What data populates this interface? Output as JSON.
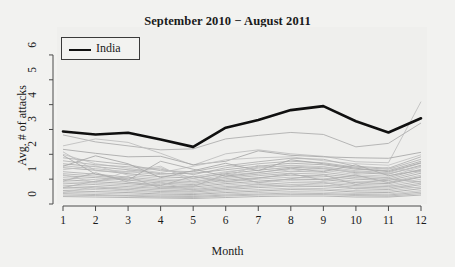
{
  "chart_data": {
    "type": "line",
    "title": "September 2010 − August 2011",
    "xlabel": "Month",
    "ylabel": "Avg. # of attacks",
    "xlim": [
      1,
      12
    ],
    "ylim": [
      0,
      6.4
    ],
    "x": [
      1,
      2,
      3,
      4,
      5,
      6,
      7,
      8,
      9,
      10,
      11,
      12
    ],
    "xticks": [
      "1",
      "2",
      "3",
      "4",
      "5",
      "6",
      "7",
      "8",
      "9",
      "10",
      "11",
      "12"
    ],
    "yticks": [
      "0",
      "1",
      "2",
      "3",
      "4",
      "5",
      "6"
    ],
    "grid": false,
    "legend": {
      "position": "top-left",
      "entries": [
        {
          "name": "India",
          "color": "#101010",
          "linewidth": 2.6
        }
      ]
    },
    "highlight_color": "#101010",
    "background_color": "#f2f2f0",
    "other_series_color": "#b0b0b0",
    "series": [
      {
        "name": "India",
        "highlighted": true,
        "color": "#101010",
        "values": [
          2.92,
          2.8,
          2.87,
          2.6,
          2.3,
          3.07,
          3.38,
          3.78,
          3.94,
          3.33,
          2.88,
          3.45
        ]
      },
      {
        "name": "other-1",
        "highlighted": false,
        "values": [
          2.78,
          2.5,
          2.34,
          2.18,
          2.22,
          2.62,
          2.76,
          2.88,
          2.8,
          2.3,
          2.44,
          3.26
        ]
      },
      {
        "name": "other-2",
        "highlighted": false,
        "values": [
          2.34,
          2.62,
          2.48,
          2.04,
          1.56,
          2.02,
          2.18,
          2.02,
          1.92,
          1.7,
          1.66,
          4.12
        ]
      },
      {
        "name": "other-3",
        "highlighted": false,
        "values": [
          2.2,
          2.04,
          1.9,
          1.92,
          1.58,
          1.72,
          2.14,
          1.96,
          1.9,
          1.86,
          1.84,
          2.08
        ]
      },
      {
        "name": "other-4",
        "highlighted": false,
        "values": [
          2.0,
          1.62,
          1.44,
          1.26,
          1.52,
          1.78,
          1.86,
          1.9,
          1.74,
          1.62,
          1.56,
          1.98
        ]
      },
      {
        "name": "other-5",
        "highlighted": false,
        "values": [
          1.86,
          1.72,
          1.58,
          1.34,
          1.3,
          1.54,
          1.7,
          1.84,
          1.8,
          1.52,
          1.44,
          1.9
        ]
      },
      {
        "name": "other-6",
        "highlighted": false,
        "values": [
          1.74,
          1.58,
          1.5,
          1.4,
          1.18,
          1.46,
          1.62,
          1.72,
          1.66,
          1.48,
          1.4,
          1.8
        ]
      },
      {
        "name": "other-7",
        "highlighted": false,
        "values": [
          1.62,
          1.5,
          1.38,
          1.22,
          1.24,
          1.38,
          1.52,
          1.64,
          1.58,
          1.4,
          1.34,
          1.72
        ]
      },
      {
        "name": "other-8",
        "highlighted": false,
        "values": [
          1.54,
          1.42,
          1.3,
          1.18,
          1.1,
          1.3,
          1.44,
          1.56,
          1.5,
          1.34,
          1.26,
          1.64
        ]
      },
      {
        "name": "other-9",
        "highlighted": false,
        "values": [
          1.46,
          1.36,
          1.22,
          1.1,
          1.04,
          1.22,
          1.36,
          1.48,
          1.42,
          1.26,
          1.2,
          1.56
        ]
      },
      {
        "name": "other-10",
        "highlighted": false,
        "values": [
          1.38,
          1.54,
          1.16,
          1.02,
          0.96,
          1.16,
          1.28,
          1.4,
          1.36,
          1.18,
          1.12,
          1.48
        ]
      },
      {
        "name": "other-11",
        "highlighted": false,
        "values": [
          1.3,
          1.2,
          1.08,
          0.96,
          0.9,
          1.08,
          1.2,
          1.32,
          1.28,
          1.12,
          1.06,
          1.4
        ]
      },
      {
        "name": "other-12",
        "highlighted": false,
        "values": [
          1.22,
          1.12,
          1.02,
          0.9,
          0.84,
          1.02,
          1.14,
          1.24,
          1.2,
          1.06,
          1.0,
          1.32
        ]
      },
      {
        "name": "other-13",
        "highlighted": false,
        "values": [
          1.14,
          1.06,
          0.96,
          0.84,
          0.78,
          0.96,
          1.06,
          1.16,
          1.12,
          1.0,
          0.94,
          1.24
        ]
      },
      {
        "name": "other-14",
        "highlighted": false,
        "values": [
          1.06,
          0.98,
          0.88,
          0.78,
          0.74,
          0.88,
          1.0,
          1.08,
          1.04,
          0.92,
          0.88,
          1.16
        ]
      },
      {
        "name": "other-15",
        "highlighted": false,
        "values": [
          0.98,
          0.9,
          0.82,
          0.72,
          0.68,
          0.82,
          0.92,
          1.0,
          0.98,
          0.86,
          0.82,
          1.08
        ]
      },
      {
        "name": "other-16",
        "highlighted": false,
        "values": [
          0.9,
          0.84,
          0.76,
          0.66,
          0.62,
          0.76,
          0.86,
          0.94,
          0.9,
          0.8,
          0.76,
          1.0
        ]
      },
      {
        "name": "other-17",
        "highlighted": false,
        "values": [
          0.84,
          0.78,
          0.7,
          0.62,
          0.58,
          0.7,
          0.78,
          0.86,
          0.84,
          0.74,
          0.7,
          0.92
        ]
      },
      {
        "name": "other-18",
        "highlighted": false,
        "values": [
          0.76,
          0.7,
          0.64,
          0.56,
          0.52,
          0.64,
          0.72,
          0.78,
          0.76,
          0.68,
          0.64,
          0.84
        ]
      },
      {
        "name": "other-19",
        "highlighted": false,
        "values": [
          0.68,
          0.64,
          0.58,
          0.5,
          0.48,
          0.58,
          0.66,
          0.72,
          0.7,
          0.62,
          0.58,
          0.78
        ]
      },
      {
        "name": "other-20",
        "highlighted": false,
        "values": [
          0.62,
          0.58,
          0.52,
          0.46,
          0.42,
          0.52,
          0.58,
          0.64,
          0.62,
          0.54,
          0.52,
          0.7
        ]
      },
      {
        "name": "other-21",
        "highlighted": false,
        "values": [
          0.54,
          0.5,
          0.46,
          0.4,
          0.38,
          0.46,
          0.52,
          0.58,
          0.56,
          0.48,
          0.46,
          0.62
        ]
      },
      {
        "name": "other-22",
        "highlighted": false,
        "values": [
          0.48,
          0.44,
          0.4,
          0.36,
          0.34,
          0.4,
          0.46,
          0.5,
          0.48,
          0.42,
          0.4,
          0.54
        ]
      },
      {
        "name": "other-23",
        "highlighted": false,
        "values": [
          0.42,
          0.38,
          0.34,
          0.32,
          0.3,
          0.36,
          0.4,
          0.44,
          0.42,
          0.38,
          0.36,
          0.48
        ]
      },
      {
        "name": "other-24",
        "highlighted": false,
        "values": [
          0.36,
          0.34,
          0.32,
          0.28,
          0.26,
          0.32,
          0.36,
          0.38,
          0.38,
          0.34,
          0.32,
          0.42
        ]
      },
      {
        "name": "other-25",
        "highlighted": false,
        "values": [
          0.3,
          0.28,
          0.26,
          0.24,
          0.22,
          0.26,
          0.3,
          0.32,
          0.32,
          0.28,
          0.28,
          0.36
        ]
      },
      {
        "name": "other-26",
        "highlighted": false,
        "values": [
          2.1,
          1.34,
          1.28,
          1.46,
          1.02,
          1.26,
          1.48,
          1.54,
          1.44,
          1.3,
          1.22,
          1.52
        ]
      },
      {
        "name": "other-27",
        "highlighted": false,
        "values": [
          1.52,
          1.94,
          1.62,
          1.06,
          1.34,
          1.64,
          1.34,
          1.78,
          1.62,
          1.44,
          1.3,
          1.66
        ]
      },
      {
        "name": "other-28",
        "highlighted": false,
        "values": [
          1.18,
          0.86,
          1.34,
          1.52,
          0.88,
          1.1,
          1.56,
          1.3,
          1.5,
          1.22,
          1.48,
          1.28
        ]
      },
      {
        "name": "other-29",
        "highlighted": false,
        "values": [
          0.92,
          1.26,
          0.88,
          0.74,
          1.12,
          0.9,
          1.04,
          1.22,
          0.96,
          1.16,
          0.86,
          1.1
        ]
      },
      {
        "name": "other-30",
        "highlighted": false,
        "values": [
          0.66,
          0.92,
          1.1,
          0.64,
          0.7,
          1.2,
          0.86,
          1.02,
          1.18,
          0.78,
          1.02,
          0.88
        ]
      },
      {
        "name": "other-31",
        "highlighted": false,
        "values": [
          1.96,
          1.2,
          0.96,
          1.72,
          1.4,
          1.12,
          1.26,
          1.44,
          1.3,
          1.58,
          1.14,
          1.36
        ]
      },
      {
        "name": "other-32",
        "highlighted": false,
        "values": [
          0.46,
          0.7,
          0.56,
          0.88,
          0.54,
          0.64,
          0.82,
          0.7,
          0.88,
          0.6,
          0.74,
          0.64
        ]
      }
    ]
  },
  "axes": {
    "y_title": "Avg. # of attacks",
    "x_title": "Month"
  }
}
